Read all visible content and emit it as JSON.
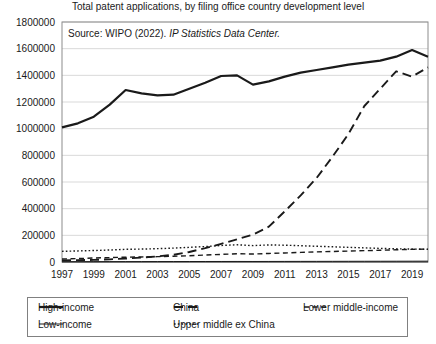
{
  "chart_data": {
    "type": "line",
    "title": "Total patent applications, by filing office country development level",
    "xlabel": "",
    "ylabel": "",
    "source_note_plain": "Source: WIPO (2022). ",
    "source_note_italic": "IP Statistics Data Center.",
    "grid": "horizontal",
    "legend_position": "bottom",
    "xlim": [
      1997,
      2020
    ],
    "ylim": [
      0,
      1800000
    ],
    "ytick_step": 200000,
    "x": [
      1997,
      1998,
      1999,
      2000,
      2001,
      2002,
      2003,
      2004,
      2005,
      2006,
      2007,
      2008,
      2009,
      2010,
      2011,
      2012,
      2013,
      2014,
      2015,
      2016,
      2017,
      2018,
      2019,
      2020
    ],
    "xtick_labels": [
      "1997",
      "1999",
      "2001",
      "2003",
      "2005",
      "2007",
      "2009",
      "2011",
      "2013",
      "2015",
      "2017",
      "2019"
    ],
    "xtick_values": [
      1997,
      1999,
      2001,
      2003,
      2005,
      2007,
      2009,
      2011,
      2013,
      2015,
      2017,
      2019
    ],
    "ytick_labels": [
      "0",
      "200000",
      "400000",
      "600000",
      "800000",
      "1000000",
      "1200000",
      "1400000",
      "1600000",
      "1800000"
    ],
    "ytick_values": [
      0,
      200000,
      400000,
      600000,
      800000,
      1000000,
      1200000,
      1400000,
      1600000,
      1800000
    ],
    "series": [
      {
        "name": "High-income",
        "style": "solid",
        "width": 2.2,
        "color": "#1a1a1a",
        "values": [
          1010000,
          1040000,
          1090000,
          1180000,
          1290000,
          1265000,
          1250000,
          1255000,
          1300000,
          1345000,
          1395000,
          1400000,
          1330000,
          1355000,
          1390000,
          1420000,
          1440000,
          1460000,
          1480000,
          1495000,
          1510000,
          1540000,
          1590000,
          1540000
        ]
      },
      {
        "name": "China",
        "style": "dashed-long",
        "width": 1.9,
        "color": "#1a1a1a",
        "values": [
          12000,
          14000,
          16000,
          20000,
          26000,
          33000,
          42000,
          54000,
          75000,
          104000,
          136000,
          170000,
          205000,
          265000,
          380000,
          500000,
          630000,
          790000,
          960000,
          1170000,
          1300000,
          1430000,
          1390000,
          1460000
        ]
      },
      {
        "name": "Lower middle-income",
        "style": "dashed-short",
        "width": 1.4,
        "color": "#1a1a1a",
        "values": [
          22000,
          26000,
          30000,
          33000,
          36000,
          38000,
          40000,
          43000,
          47000,
          52000,
          57000,
          62000,
          60000,
          64000,
          68000,
          72000,
          76000,
          79000,
          82000,
          85000,
          88000,
          92000,
          95000,
          97000
        ]
      },
      {
        "name": "Low-income",
        "style": "solid",
        "width": 1.0,
        "color": "#1a1a1a",
        "values": [
          2000,
          2200,
          2400,
          2600,
          2800,
          3000,
          3200,
          3400,
          3600,
          3800,
          4000,
          4200,
          4000,
          4200,
          4400,
          4600,
          4800,
          5000,
          5200,
          5400,
          5600,
          5800,
          6000,
          6200
        ]
      },
      {
        "name": "Upper middle ex China",
        "style": "dotted",
        "width": 1.4,
        "color": "#1a1a1a",
        "values": [
          80000,
          83000,
          86000,
          90000,
          95000,
          97000,
          100000,
          104000,
          110000,
          116000,
          124000,
          129000,
          123000,
          128000,
          126000,
          122000,
          118000,
          114000,
          110000,
          106000,
          102000,
          99000,
          97000,
          95000
        ]
      }
    ],
    "legend_entries": [
      {
        "label": "High-income",
        "style": "solid",
        "width": 2.2
      },
      {
        "label": "China",
        "style": "dashed-long",
        "width": 1.9
      },
      {
        "label": "Lower middle-income",
        "style": "dashed-short",
        "width": 1.4
      },
      {
        "label": "Low-income",
        "style": "solid",
        "width": 1.0
      },
      {
        "label": "Upper middle ex China",
        "style": "dotted",
        "width": 1.4
      }
    ]
  }
}
